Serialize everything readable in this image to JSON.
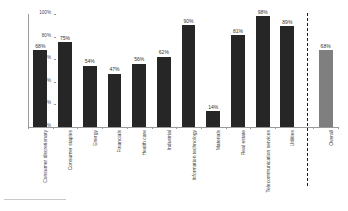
{
  "chart_data": {
    "type": "bar",
    "title": "",
    "subtitle": "",
    "xlabel": "",
    "ylabel": "",
    "ylim": [
      0,
      100
    ],
    "grid": false,
    "legend": false,
    "value_suffix": "%",
    "categories": [
      "Consumer discretionary",
      "Consumer staples",
      "Energy",
      "Financials",
      "Health care",
      "Industrial",
      "Information technology",
      "Materials",
      "Real estate",
      "Telecommunication services",
      "Utilities",
      "Overall"
    ],
    "values": [
      68,
      75,
      54,
      47,
      56,
      62,
      90,
      14,
      81,
      98,
      89,
      68
    ],
    "value_labels": [
      "68%",
      "75%",
      "54%",
      "47%",
      "56%",
      "62%",
      "90%",
      "14%",
      "81%",
      "98%",
      "89%",
      "68%"
    ],
    "ytick_labels": [
      "0%",
      "20%",
      "40%",
      "60%",
      "80%",
      "100%"
    ],
    "ytick_values": [
      0,
      20,
      40,
      60,
      80,
      100
    ],
    "bar_colors": [
      "#262626",
      "#262626",
      "#262626",
      "#262626",
      "#262626",
      "#262626",
      "#262626",
      "#262626",
      "#262626",
      "#262626",
      "#262626",
      "#7f7f7f"
    ],
    "separator_after_index": 10,
    "separator_style": "dashed",
    "axis_color": "#9a9a9a",
    "text_color": "#3a3a3a",
    "background": "#ffffff"
  }
}
